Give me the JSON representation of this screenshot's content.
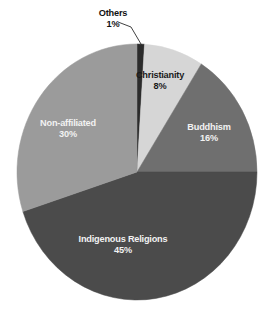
{
  "chart_data": {
    "type": "pie",
    "title": "",
    "subtitle": "",
    "xlabel": "",
    "ylabel": "",
    "legend_position": "none",
    "grid": false,
    "units": "percent",
    "start_angle_deg": 0,
    "direction": "clockwise",
    "categories": [
      "Others",
      "Christianity",
      "Buddhism",
      "Indigenous Religions",
      "Non-affiliated"
    ],
    "values": [
      1,
      8,
      16,
      45,
      30
    ],
    "labels": [
      "1%",
      "8%",
      "16%",
      "45%",
      "30%"
    ],
    "colors": [
      "#2b2b2b",
      "#d6d6d6",
      "#6f6f6f",
      "#4b4b4b",
      "#9b9b9b"
    ],
    "slices": [
      {
        "name": "Others",
        "value": 1,
        "value_label": "1%",
        "color": "#2b2b2b",
        "label_placement": "outside",
        "leader_line": true
      },
      {
        "name": "Christianity",
        "value": 8,
        "value_label": "8%",
        "color": "#d6d6d6",
        "label_placement": "inside",
        "leader_line": false
      },
      {
        "name": "Buddhism",
        "value": 16,
        "value_label": "16%",
        "color": "#6f6f6f",
        "label_placement": "inside",
        "leader_line": false
      },
      {
        "name": "Indigenous Religions",
        "value": 45,
        "value_label": "45%",
        "color": "#4b4b4b",
        "label_placement": "inside",
        "leader_line": false
      },
      {
        "name": "Non-affiliated",
        "value": 30,
        "value_label": "30%",
        "color": "#9b9b9b",
        "label_placement": "inside",
        "leader_line": false
      }
    ]
  },
  "figure": {
    "background_color": "#ffffff",
    "center_x": 137,
    "center_y": 172,
    "radius_x": 120,
    "radius_y": 128
  }
}
